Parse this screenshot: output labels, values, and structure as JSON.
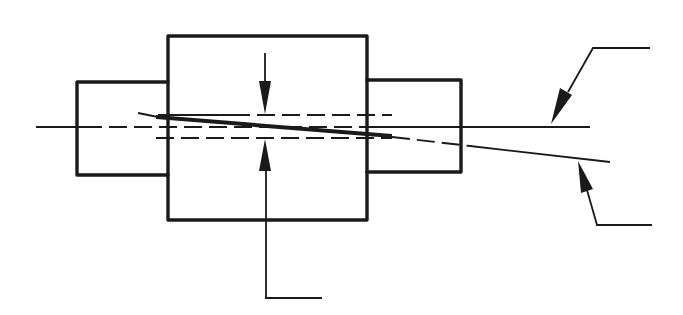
{
  "diagram": {
    "type": "technical-drawing",
    "colors": {
      "line": "#1a1a1a",
      "background": "#ffffff"
    },
    "components": {
      "left_shaft": {
        "x": 76,
        "y": 82,
        "w": 92,
        "h": 93
      },
      "coupling_body": {
        "x": 168,
        "y": 36,
        "w": 199,
        "h": 184
      },
      "right_shaft": {
        "x": 367,
        "y": 79,
        "w": 94,
        "h": 93
      }
    },
    "lines": {
      "centerline": {
        "y": 127,
        "x1": 36,
        "x2": 590,
        "style": "dash-chain"
      },
      "upper_offset": {
        "y": 115,
        "x1": 158,
        "x2": 392,
        "style": "dashed"
      },
      "lower_offset": {
        "y": 138,
        "x1": 156,
        "x2": 392,
        "style": "dashed"
      },
      "angular_axis": {
        "x1": 138,
        "y1": 113,
        "x2": 610,
        "y2": 162
      }
    },
    "dimension_arrows": [
      {
        "name": "offset-arrow-down",
        "x": 265,
        "from_y": 53,
        "to_y": 114
      },
      {
        "name": "offset-arrow-up",
        "x": 265,
        "from_y": 298,
        "to_y": 139
      }
    ],
    "leaders": [
      {
        "name": "leader-centerline",
        "points": [
          [
            650,
            48
          ],
          [
            593,
            48
          ],
          [
            551,
            124
          ]
        ],
        "label": ""
      },
      {
        "name": "leader-angular-axis",
        "points": [
          [
            652,
            225
          ],
          [
            597,
            225
          ],
          [
            578,
            161
          ]
        ],
        "label": ""
      },
      {
        "name": "leader-offset",
        "points": [
          [
            322,
            298
          ],
          [
            266,
            298
          ],
          [
            266,
            139
          ]
        ],
        "label": ""
      }
    ],
    "labels": []
  }
}
